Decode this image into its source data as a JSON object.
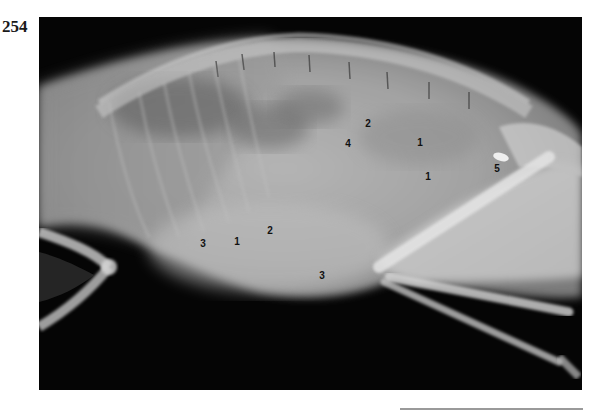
{
  "page": {
    "number": "254"
  },
  "figure": {
    "type": "lateral abdominal radiograph",
    "background_color": "#050505",
    "labels": [
      {
        "text": "2",
        "x": 329,
        "y": 107
      },
      {
        "text": "4",
        "x": 309,
        "y": 127
      },
      {
        "text": "1",
        "x": 381,
        "y": 126
      },
      {
        "text": "1",
        "x": 389,
        "y": 160
      },
      {
        "text": "5",
        "x": 458,
        "y": 152
      },
      {
        "text": "3",
        "x": 164,
        "y": 227
      },
      {
        "text": "1",
        "x": 198,
        "y": 225
      },
      {
        "text": "2",
        "x": 231,
        "y": 214
      },
      {
        "text": "3",
        "x": 283,
        "y": 259
      }
    ]
  }
}
